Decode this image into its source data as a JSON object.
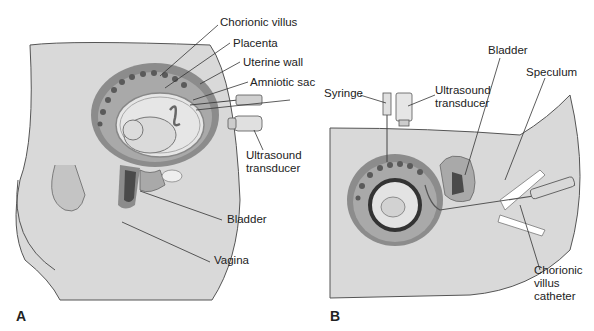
{
  "figure": {
    "panels": [
      {
        "id": "A",
        "label": "A",
        "title": "Transabdominal chorionic villus sampling",
        "callouts": {
          "chorionic_villus": "Chorionic villus",
          "placenta": "Placenta",
          "uterine_wall": "Uterine wall",
          "amniotic_sac": "Amniotic sac",
          "ultrasound_transducer_1": "Ultrasound",
          "ultrasound_transducer_2": "transducer",
          "bladder": "Bladder",
          "vagina": "Vagina"
        }
      },
      {
        "id": "B",
        "label": "B",
        "title": "Transcervical chorionic villus sampling",
        "callouts": {
          "syringe": "Syringe",
          "ultrasound_transducer_1": "Ultrasound",
          "ultrasound_transducer_2": "transducer",
          "bladder": "Bladder",
          "speculum": "Speculum",
          "catheter_1": "Chorionic",
          "catheter_2": "villus",
          "catheter_3": "catheter"
        }
      }
    ],
    "colors": {
      "body": "#d9d9d9",
      "tissue": "#a9a9a9",
      "uterine_wall": "#8c8c8c",
      "dark": "#4a4a4a",
      "light": "#efefef",
      "line": "#333333"
    }
  }
}
